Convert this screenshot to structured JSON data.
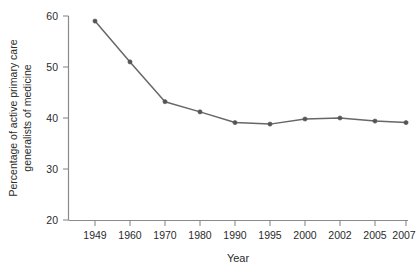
{
  "chart_data": {
    "type": "line",
    "title": "",
    "xlabel": "Year",
    "ylabel": "Percentage of active primary care generalists of medicine",
    "ylabel_lines": [
      "Percentage of active primary care",
      "generalists of medicine"
    ],
    "categories": [
      "1949",
      "1960",
      "1970",
      "1980",
      "1990",
      "1995",
      "2000",
      "2002",
      "2005",
      "2007"
    ],
    "values": [
      59,
      51,
      43.2,
      41.2,
      39.1,
      38.8,
      39.8,
      40,
      39.4,
      39.1
    ],
    "ylim": [
      20,
      60
    ],
    "yticks": [
      "20",
      "30",
      "40",
      "50",
      "60"
    ],
    "ytick_values": [
      20,
      30,
      40,
      50,
      60
    ],
    "grid": false,
    "legend": null,
    "series": [
      {
        "name": "Percentage of active primary care generalists of medicine",
        "values": [
          59,
          51,
          43.2,
          41.2,
          39.1,
          38.8,
          39.8,
          40,
          39.4,
          39.1
        ]
      }
    ],
    "colors": {
      "line": "#676767",
      "marker": "#555555",
      "axis": "#8a8a8a",
      "text": "#2b2b2b",
      "background": "#ffffff"
    }
  }
}
